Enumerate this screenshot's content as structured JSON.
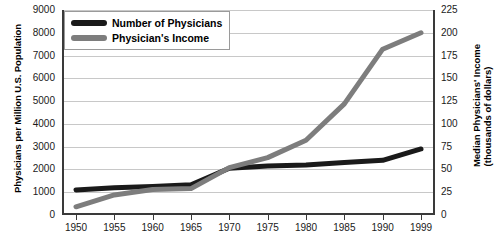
{
  "chart_data": {
    "type": "line",
    "title": "",
    "xlabel": "",
    "ylabel": "Physicians per Million U.S. Population",
    "ylabel_right_line1": "Median Physicians' Income",
    "ylabel_right_line2": "(thousands of dollars)",
    "grid": true,
    "legend_position": "top-left",
    "categories": [
      "1950",
      "1955",
      "1960",
      "1965",
      "1970",
      "1975",
      "1980",
      "1985",
      "1990",
      "1999"
    ],
    "x": [
      1950,
      1955,
      1960,
      1965,
      1970,
      1975,
      1980,
      1985,
      1990,
      1999
    ],
    "ylim": [
      0,
      9000
    ],
    "ylim_right": [
      0,
      225
    ],
    "yticks": [
      "0",
      "1000",
      "2000",
      "3000",
      "4000",
      "5000",
      "6000",
      "7000",
      "8000",
      "9000"
    ],
    "yticks_right": [
      "0",
      "25",
      "50",
      "75",
      "100",
      "125",
      "150",
      "175",
      "200",
      "225"
    ],
    "series": [
      {
        "name": "Number of Physicians",
        "axis": "left",
        "color": "#1a1a1a",
        "units": "physicians per million U.S. population",
        "values": [
          1100,
          1200,
          1250,
          1330,
          2050,
          2150,
          2200,
          2300,
          2400,
          2900
        ]
      },
      {
        "name": "Physician's Income",
        "axis": "right",
        "color": "#7d7d7d",
        "units": "thousands of dollars",
        "values": [
          9,
          22,
          28,
          29,
          52,
          63,
          82,
          122,
          182,
          200
        ]
      }
    ]
  },
  "legend": {
    "items": [
      {
        "label": "Number of Physicians",
        "color": "#1a1a1a"
      },
      {
        "label": "Physician's Income",
        "color": "#7d7d7d"
      }
    ]
  }
}
